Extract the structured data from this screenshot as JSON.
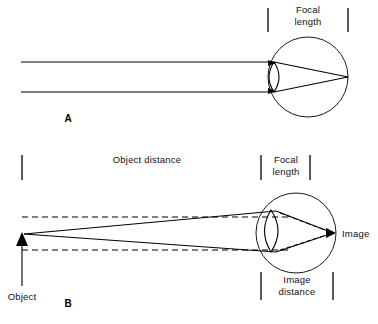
{
  "figure": {
    "background_color": "#ffffff",
    "line_color": "#000000",
    "width": 378,
    "height": 324
  },
  "panel_a": {
    "panel_label": "A",
    "focal_length_label_line1": "Focal",
    "focal_length_label_line2": "length",
    "description": "Parallel light rays entering the eye are refracted by the lens and converge at the retina at one focal length",
    "ray_count": 2,
    "eye": {
      "center_x": 308,
      "center_y": 77,
      "radius": 40
    },
    "lens": {
      "x": 274,
      "top_y": 62,
      "bottom_y": 92
    },
    "focal_point_x": 348,
    "focal_point_y": 77,
    "ray_top_y": 62,
    "ray_bottom_y": 92,
    "ray_start_x": 21,
    "bracket_left_x": 268,
    "bracket_right_x": 348
  },
  "panel_b": {
    "panel_label": "B",
    "object_distance_label": "Object distance",
    "focal_length_label_line1": "Focal",
    "focal_length_label_line2": "length",
    "image_distance_label_line1": "Image",
    "image_distance_label_line2": "distance",
    "object_label": "Object",
    "image_label": "Image",
    "description": "Light from a near object diverges, the lens refracts it, and the image forms behind the focal point",
    "eye": {
      "center_x": 296,
      "center_y": 233,
      "radius": 40
    },
    "lens": {
      "x": 271,
      "top_y": 210,
      "bottom_y": 252
    },
    "object_x": 22,
    "object_tip_y": 234,
    "object_base_y": 286,
    "image_point_x": 333,
    "image_point_y": 233,
    "dashed_upper_y": 217,
    "dashed_lower_y": 250,
    "object_distance_bracket_left_x": 22,
    "object_distance_bracket_right_x": 261,
    "focal_bracket_left_x": 261,
    "focal_bracket_right_x": 310,
    "image_distance_bracket_left_x": 261,
    "image_distance_bracket_right_x": 333
  }
}
